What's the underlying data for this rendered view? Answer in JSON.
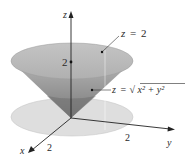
{
  "diagram": {
    "type": "3d-surface-sketch",
    "axes": {
      "x": {
        "label": "x",
        "tick": "2"
      },
      "y": {
        "label": "y",
        "tick": "2"
      },
      "z": {
        "label": "z",
        "tick": "2"
      }
    },
    "annotations": {
      "plane": {
        "lhs": "z",
        "eq": "=",
        "rhs": "2"
      },
      "cone": {
        "lhs": "z",
        "eq": "=",
        "radical": "√",
        "radicand": "x² + y²"
      }
    },
    "colors": {
      "cone_top": "#b9b9b9",
      "cone_side_light": "#a9a9a9",
      "cone_side_dark": "#7f7f7f",
      "disk": "#dcdcdc",
      "axis": "#222222"
    }
  }
}
